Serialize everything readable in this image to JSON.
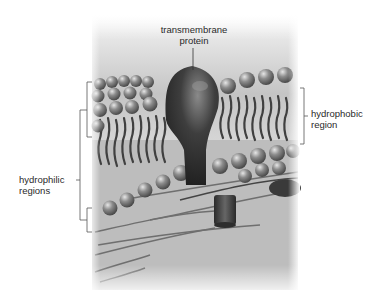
{
  "diagram": {
    "labels": {
      "protein": [
        "transmembrane",
        "protein"
      ],
      "hydrophobic": [
        "hydrophobic",
        "region"
      ],
      "hydrophilic": [
        "hydrophilic",
        "regions"
      ]
    },
    "colors": {
      "background": "#ffffff",
      "protein": "#3a3a3a",
      "lipid_head": "#8a8a8a",
      "tail": "#4a4a4a",
      "cytoplasm": "#b8b8b8",
      "bracket": "#555555"
    }
  }
}
